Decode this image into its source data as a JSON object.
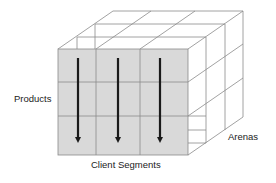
{
  "diagram": {
    "type": "3d-cube-matrix",
    "labels": {
      "products": "Products",
      "client_segments": "Client Segments",
      "arenas": "Arenas"
    },
    "grid": {
      "rows": 3,
      "columns": 3,
      "depth": 3
    },
    "arrows": {
      "count": 3,
      "direction": "down"
    },
    "colors": {
      "front_face_fill": "#d9d9d9",
      "grid_line": "#8a8a8a",
      "arrow": "#1a1a1a",
      "text": "#222222"
    }
  }
}
